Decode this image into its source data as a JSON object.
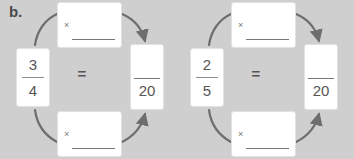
{
  "exercise": {
    "label": "b.",
    "background_color": "#cfcfcf",
    "card_color": "#ffffff",
    "ink_color": "#555555"
  },
  "groups": [
    {
      "id": "left",
      "fraction": {
        "numerator": "3",
        "denominator": "4"
      },
      "equals": "=",
      "result": {
        "numerator": "",
        "denominator": "20"
      },
      "top_operation": {
        "operator": "×",
        "value": ""
      },
      "bottom_operation": {
        "operator": "×",
        "value": ""
      }
    },
    {
      "id": "right",
      "fraction": {
        "numerator": "2",
        "denominator": "5"
      },
      "equals": "=",
      "result": {
        "numerator": "",
        "denominator": "20"
      },
      "top_operation": {
        "operator": "×",
        "value": ""
      },
      "bottom_operation": {
        "operator": "×",
        "value": ""
      }
    }
  ]
}
